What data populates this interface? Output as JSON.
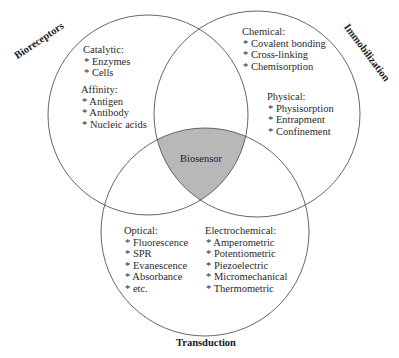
{
  "diagram": {
    "type": "venn",
    "center_label": "Biosensor",
    "colors": {
      "circle_stroke": "#555555",
      "intersection_fill": "#b8b8b8",
      "background": "#ffffff"
    },
    "sets": [
      {
        "id": "bioreceptors",
        "label": "Bioreceptors",
        "groups": [
          {
            "heading": "Catalytic:",
            "items": [
              "* Enzymes",
              "* Cells"
            ]
          },
          {
            "heading": "Affinity:",
            "items": [
              "* Antigen",
              "* Antibody",
              "* Nucleic acids"
            ]
          }
        ]
      },
      {
        "id": "immobilization",
        "label": "Immobilization",
        "groups": [
          {
            "heading": "Chemical:",
            "items": [
              "* Covalent bonding",
              "* Cross-linking",
              "* Chemisorption"
            ]
          },
          {
            "heading": "Physical:",
            "items": [
              "* Physisorption",
              "* Entrapment",
              "* Confinement"
            ]
          }
        ]
      },
      {
        "id": "transduction",
        "label": "Transduction",
        "groups": [
          {
            "heading": "Optical:",
            "items": [
              "* Fluorescence",
              "* SPR",
              "* Evanescence",
              "* Absorbance",
              "* etc."
            ]
          },
          {
            "heading": "Electrochemical:",
            "items": [
              "* Amperometric",
              "* Potentiometric",
              "* Piezoelectric",
              "* Micromechanical",
              "* Thermometric"
            ]
          }
        ]
      }
    ]
  }
}
